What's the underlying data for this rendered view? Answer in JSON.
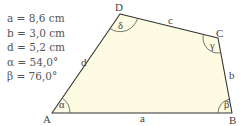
{
  "given": {
    "a": "a = 8,6 cm",
    "b": "b = 3,0 cm",
    "d": "d = 5,2 cm",
    "alpha": "α = 54,0°",
    "beta": "β = 76,0°"
  },
  "figure": {
    "fill_color": "#fdfbe2",
    "stroke_color": "#333333",
    "vertices": {
      "A": "A",
      "B": "B",
      "C": "C",
      "D": "D"
    },
    "sides": {
      "a": "a",
      "b": "b",
      "c": "c",
      "d": "d"
    },
    "angles": {
      "alpha": "α",
      "beta": "β",
      "gamma": "γ",
      "delta": "δ"
    }
  }
}
